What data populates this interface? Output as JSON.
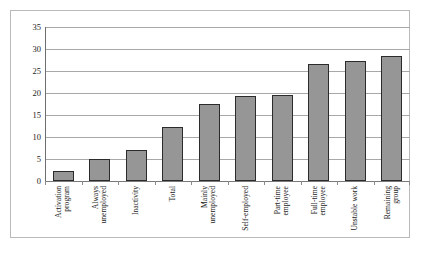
{
  "chart_data": {
    "type": "bar",
    "title": "",
    "xlabel": "",
    "ylabel": "",
    "ylim": [
      0,
      35
    ],
    "ytick_step": 5,
    "yticks": [
      "35",
      "30",
      "25",
      "20",
      "15",
      "10",
      "5",
      "0"
    ],
    "grid": true,
    "legend": "none",
    "bar_color": "#969696",
    "bar_border_color": "#2b2b2b",
    "frame_color": "#b9b9b9",
    "gridline_color": "#a8a8a8",
    "categories": [
      "Activation program",
      "Always unemployed",
      "Inactivity",
      "Total",
      "Mainly unemployed",
      "Self-employed",
      "Part-time employee",
      "Full-time employee",
      "Unstable work",
      "Remaining group"
    ],
    "category_lines": [
      [
        "Activation",
        "program"
      ],
      [
        "Always",
        "unemployed"
      ],
      [
        "Inactivity"
      ],
      [
        "Total"
      ],
      [
        "Mainly",
        "unemployed"
      ],
      [
        "Self-employed"
      ],
      [
        "Part-time",
        "employee"
      ],
      [
        "Full-time",
        "employee"
      ],
      [
        "Unstable work"
      ],
      [
        "Remaining",
        "group"
      ]
    ],
    "values": [
      2.3,
      5.0,
      7.0,
      12.3,
      17.5,
      19.3,
      19.5,
      26.5,
      27.3,
      28.3
    ]
  }
}
